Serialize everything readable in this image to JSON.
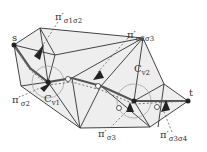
{
  "figure": {
    "points": {
      "s": {
        "label": "s",
        "x": 14,
        "y": 45
      },
      "t": {
        "label": "t",
        "x": 188,
        "y": 101
      }
    },
    "labels": [
      {
        "id": "pi_s1s2",
        "main": "π′",
        "subs": "σ1σ2",
        "text": "π′σ1σ2",
        "x": 55,
        "y": 16
      },
      {
        "id": "pi_s2s3",
        "main": "π′",
        "subs": "σ2σ3",
        "text": "π′σ2σ3",
        "x": 127,
        "y": 34
      },
      {
        "id": "pi_s2",
        "main": "π′",
        "subs": "σ2",
        "text": "π′σ2",
        "x": 12,
        "y": 99
      },
      {
        "id": "cv1",
        "main": "C",
        "subs": "v1",
        "text": "Cv1",
        "x": 44,
        "y": 98
      },
      {
        "id": "cv2",
        "main": "C",
        "subs": "v2",
        "text": "Cv2",
        "x": 134,
        "y": 68
      },
      {
        "id": "pi_s3",
        "main": "π′",
        "subs": "σ3",
        "text": "π′σ3",
        "x": 98,
        "y": 133
      },
      {
        "id": "pi_s3s4",
        "main": "π′",
        "subs": "σ3σ4",
        "text": "π′σ3σ4",
        "x": 160,
        "y": 134
      }
    ]
  }
}
